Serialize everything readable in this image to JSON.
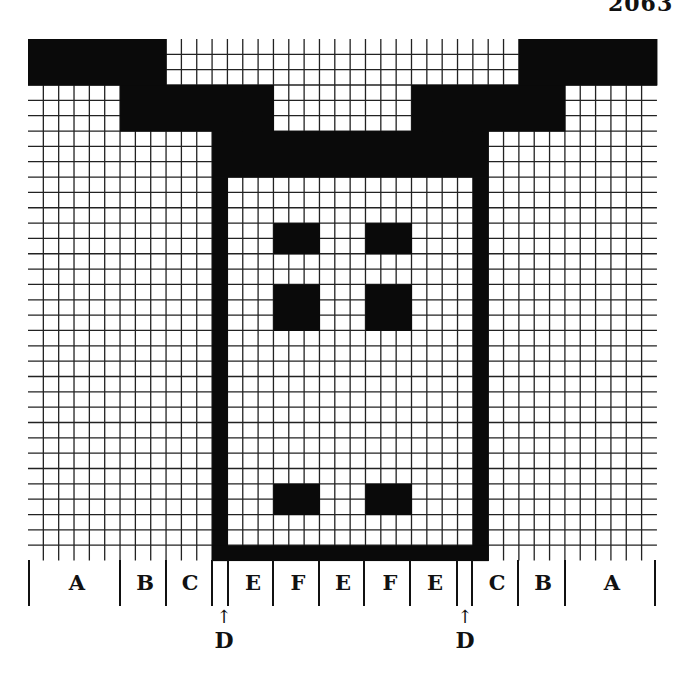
{
  "corner_text": "2063",
  "pattern": {
    "cols": 41,
    "rows": 34,
    "cell_px": 15.34,
    "grid_line_color": "#222222",
    "fill_color": "#0a0a0a",
    "background_color": "#ffffff",
    "black_regions": [
      {
        "name": "top-band-left",
        "col": 0,
        "row": 0,
        "w": 9,
        "h": 3
      },
      {
        "name": "top-band-right",
        "col": 32,
        "row": 0,
        "w": 9,
        "h": 3
      },
      {
        "name": "step-left",
        "col": 6,
        "row": 3,
        "w": 10,
        "h": 3
      },
      {
        "name": "step-right",
        "col": 25,
        "row": 3,
        "w": 10,
        "h": 3
      },
      {
        "name": "yoke",
        "col": 12,
        "row": 6,
        "w": 18,
        "h": 3
      },
      {
        "name": "frame-left",
        "col": 12,
        "row": 9,
        "w": 1,
        "h": 25
      },
      {
        "name": "frame-right",
        "col": 29,
        "row": 9,
        "w": 1,
        "h": 25
      },
      {
        "name": "frame-bottom",
        "col": 12,
        "row": 33,
        "w": 18,
        "h": 1
      },
      {
        "name": "square-1-left",
        "col": 16,
        "row": 12,
        "w": 3,
        "h": 2
      },
      {
        "name": "square-1-right",
        "col": 22,
        "row": 12,
        "w": 3,
        "h": 2
      },
      {
        "name": "square-2-left",
        "col": 16,
        "row": 16,
        "w": 3,
        "h": 3
      },
      {
        "name": "square-2-right",
        "col": 22,
        "row": 16,
        "w": 3,
        "h": 3
      },
      {
        "name": "square-3-left",
        "col": 16,
        "row": 29,
        "w": 3,
        "h": 2
      },
      {
        "name": "square-3-right",
        "col": 22,
        "row": 29,
        "w": 3,
        "h": 2
      }
    ]
  },
  "section_labels": [
    {
      "label": "A",
      "x": 77
    },
    {
      "label": "B",
      "x": 145
    },
    {
      "label": "C",
      "x": 190
    },
    {
      "label": "E",
      "x": 253
    },
    {
      "label": "F",
      "x": 298
    },
    {
      "label": "E",
      "x": 343
    },
    {
      "label": "F",
      "x": 390
    },
    {
      "label": "E",
      "x": 435
    },
    {
      "label": "C",
      "x": 497
    },
    {
      "label": "B",
      "x": 543
    },
    {
      "label": "A",
      "x": 612
    }
  ],
  "section_dividers_x": [
    29,
    120,
    166,
    212,
    228,
    273,
    319,
    364,
    410,
    457,
    472,
    518,
    565,
    655
  ],
  "d_markers": [
    {
      "label": "D",
      "arrow": "↑",
      "x": 224
    },
    {
      "label": "D",
      "arrow": "↑",
      "x": 465
    }
  ]
}
